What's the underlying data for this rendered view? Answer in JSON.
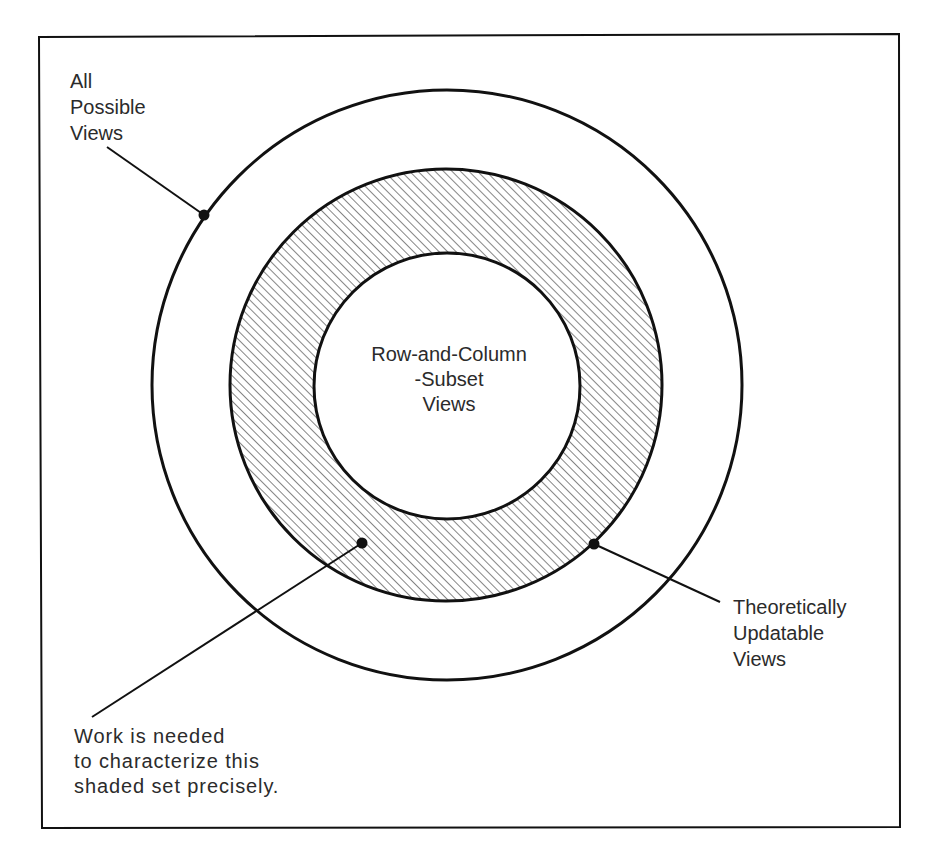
{
  "diagram": {
    "type": "nested-set-diagram",
    "colors": {
      "ink": "#111111",
      "text": "#2b2b2b",
      "background": "#ffffff",
      "hatch": "#444444"
    },
    "sets": [
      {
        "id": "all",
        "label_lines": [
          "All",
          "Possible",
          "Views"
        ]
      },
      {
        "id": "updatable",
        "label_lines": [
          "Theoretically",
          "Updatable",
          "Views"
        ]
      },
      {
        "id": "rcs",
        "label_lines": [
          "Row-and-Column",
          "-Subset",
          "Views"
        ]
      }
    ],
    "shaded_note": {
      "lines": [
        "Work is needed",
        "to characterize this",
        "shaded set precisely."
      ]
    }
  }
}
